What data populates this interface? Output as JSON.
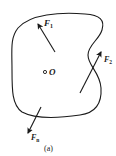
{
  "diagram": {
    "type": "rigid-body-force-system",
    "body_outline_color": "#1a1a1a",
    "point": {
      "label": "O"
    },
    "forces": [
      {
        "id": "F1",
        "label": "F",
        "subscript": "1"
      },
      {
        "id": "F2",
        "label": "F",
        "subscript": "2"
      },
      {
        "id": "Fn",
        "label": "F",
        "subscript": "n"
      }
    ],
    "caption": "(a)"
  }
}
